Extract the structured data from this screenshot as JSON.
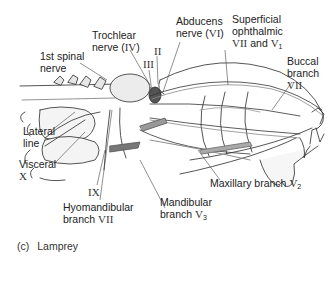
{
  "figure": {
    "caption_letter": "(c)",
    "caption_title": "Lamprey"
  },
  "labels": {
    "first_spinal": {
      "line1": "1st spinal",
      "line2": "nerve"
    },
    "trochlear": {
      "line1": "Trochlear",
      "line2_text": "nerve (",
      "line2_roman": "IV",
      "line2_end": ")"
    },
    "optic": {
      "roman": "II"
    },
    "oculomotor": {
      "roman": "III"
    },
    "abducens": {
      "line1": "Abducens",
      "line2_text": "nerve (",
      "line2_roman": "VI",
      "line2_end": ")"
    },
    "superficial_ophthalmic": {
      "line1": "Superficial",
      "line2": "ophthalmic",
      "line3_roman_a": "VII",
      "line3_and": " and ",
      "line3_roman_b": "V",
      "line3_sub": "1"
    },
    "buccal": {
      "line1": "Buccal",
      "line2": "branch",
      "roman": "VII"
    },
    "lateral_line": {
      "line1": "Lateral",
      "line2": "line"
    },
    "visceral": {
      "line1": "Visceral",
      "roman": "X"
    },
    "glossopharyngeal": {
      "roman": "IX"
    },
    "hyomandibular": {
      "line1": "Hyomandibular",
      "line2_text": "branch ",
      "roman": "VII"
    },
    "mandibular": {
      "line1": "Mandibular",
      "line2_text": "branch ",
      "roman": "V",
      "sub": "3"
    },
    "maxillary": {
      "text": "Maxillary branch ",
      "roman": "V",
      "sub": "2"
    }
  },
  "colors": {
    "ink": "#2a2a2a",
    "shade": "#9a9a9a",
    "background": "#ffffff"
  }
}
